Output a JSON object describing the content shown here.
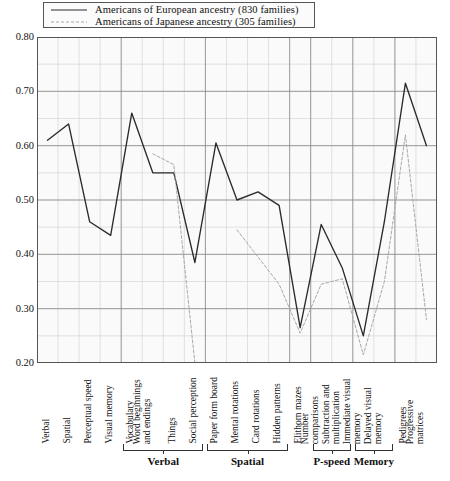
{
  "chart_data": {
    "type": "line",
    "title": "",
    "xlabel": "",
    "ylabel": "",
    "ylim": [
      0.2,
      0.8
    ],
    "ytick_labels": [
      "0.80",
      "0.70",
      "0.60",
      "0.50",
      "0.40",
      "0.30",
      "0.20"
    ],
    "ytick_values": [
      0.8,
      0.7,
      0.6,
      0.5,
      0.4,
      0.3,
      0.2
    ],
    "grid": true,
    "grid_minor_step": 0.05,
    "legend_position": "top-left",
    "categories": [
      "Verbal",
      "Spatial",
      "Perceptual speed",
      "Visual memory",
      "Vocabulary",
      "Word beginnings and endings",
      "Things",
      "Social perception",
      "Paper form board",
      "Mental rotations",
      "Card rotations",
      "Hidden patterns",
      "Elithorn mazes",
      "Number comparisons",
      "Subtraction and multiplication",
      "Immediate visual memory",
      "Delayed visual memory",
      "Pedigrees",
      "Progressive matrices"
    ],
    "series": [
      {
        "name": "Americans of European ancestry (830 families)",
        "style": "solid",
        "color": "#2b2b2b",
        "values": [
          0.61,
          0.64,
          0.46,
          0.435,
          0.66,
          0.55,
          0.55,
          0.385,
          0.605,
          0.5,
          0.515,
          0.49,
          0.265,
          0.455,
          0.375,
          0.25,
          0.46,
          0.715,
          0.6
        ]
      },
      {
        "name": "Americans of Japanese ancestry (305 families)",
        "style": "dashed",
        "color": "#a8a8a8",
        "values": [
          null,
          0.55,
          null,
          0.25,
          null,
          0.585,
          0.565,
          0.2,
          null,
          0.445,
          0.395,
          0.345,
          0.255,
          0.345,
          0.355,
          0.215,
          0.35,
          0.62,
          0.28
        ]
      }
    ],
    "groups": [
      {
        "label": "Verbal",
        "start_index": 4,
        "end_index": 7
      },
      {
        "label": "Spatial",
        "start_index": 8,
        "end_index": 11
      },
      {
        "label": "P-speed",
        "start_index": 13,
        "end_index": 14
      },
      {
        "label": "Memory",
        "start_index": 15,
        "end_index": 16
      }
    ]
  },
  "legend": {
    "items": [
      {
        "label": "Americans of European ancestry (830 families)",
        "style": "solid"
      },
      {
        "label": "Americans of Japanese ancestry (305 families)",
        "style": "dashed"
      }
    ]
  },
  "colors": {
    "series_european": "#2b2b2b",
    "series_japanese": "#a8a8a8",
    "grid_major": "#8a8a8a",
    "grid_minor": "#d5d5d5",
    "axis": "#555555",
    "plot_background": "#fafafa"
  }
}
